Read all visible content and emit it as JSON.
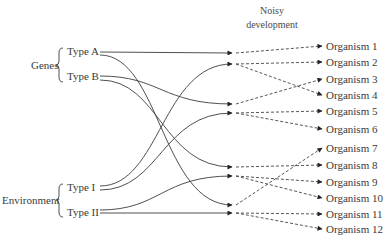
{
  "header": {
    "line1": "Noisy",
    "line2": "development"
  },
  "groups": [
    {
      "label": "Genes",
      "types": [
        "Type A",
        "Type B"
      ]
    },
    {
      "label": "Environment",
      "types": [
        "Type I",
        "Type II"
      ]
    }
  ],
  "organisms": [
    "Organism 1",
    "Organism 2",
    "Organism 3",
    "Organism 4",
    "Organism 5",
    "Organism 6",
    "Organism 7",
    "Organism 8",
    "Organism 9",
    "Organism 10",
    "Organism 11",
    "Organism 12"
  ],
  "solid_links": [
    {
      "from": "Type A",
      "to_node": 1
    },
    {
      "from": "Type A",
      "to_node": 7
    },
    {
      "from": "Type B",
      "to_node": 3
    },
    {
      "from": "Type B",
      "to_node": 5
    },
    {
      "from": "Type I",
      "to_node": 2
    },
    {
      "from": "Type I",
      "to_node": 4
    },
    {
      "from": "Type II",
      "to_node": 6
    },
    {
      "from": "Type II",
      "to_node": 8
    }
  ],
  "dashed_links": [
    {
      "node": 1,
      "to": "Organism 1"
    },
    {
      "node": 2,
      "to": "Organism 2"
    },
    {
      "node": 2,
      "to": "Organism 4"
    },
    {
      "node": 3,
      "to": "Organism 3"
    },
    {
      "node": 4,
      "to": "Organism 5"
    },
    {
      "node": 4,
      "to": "Organism 6"
    },
    {
      "node": 5,
      "to": "Organism 8"
    },
    {
      "node": 6,
      "to": "Organism 9"
    },
    {
      "node": 6,
      "to": "Organism 10"
    },
    {
      "node": 7,
      "to": "Organism 7"
    },
    {
      "node": 8,
      "to": "Organism 11"
    },
    {
      "node": 8,
      "to": "Organism 12"
    }
  ]
}
